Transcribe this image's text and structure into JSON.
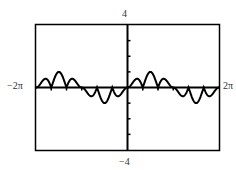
{
  "chart_data": {
    "type": "line",
    "title": "",
    "xlabel": "",
    "ylabel": "",
    "function": "y = sin(x) * |sin(3x)|",
    "xlim": [
      -6.2832,
      6.2832
    ],
    "ylim": [
      -4,
      4
    ],
    "x_tick_labels": {
      "min": "−2π",
      "max": "2π"
    },
    "y_tick_labels": {
      "min": "−4",
      "max": "4"
    },
    "y_tick_step": 1,
    "x_tick_step": 1.0472,
    "grid": false,
    "legend": null,
    "series": [
      {
        "name": "f(x)",
        "color": "#000000",
        "samples": {
          "x": [
            -6.2832,
            -5.7596,
            -5.236,
            -4.7124,
            -4.1888,
            -3.6652,
            -3.1416,
            -2.618,
            -2.0944,
            -1.5708,
            -1.0472,
            -0.5236,
            0,
            0.5236,
            1.0472,
            1.5708,
            2.0944,
            2.618,
            3.1416,
            3.6652,
            4.1888,
            4.7124,
            5.236,
            5.7596,
            6.2832
          ],
          "y": [
            0,
            0.5,
            0,
            1,
            0,
            0.5,
            0,
            -0.5,
            0,
            -1,
            0,
            -0.5,
            0,
            0.5,
            0,
            1,
            0,
            0.5,
            0,
            -0.5,
            0,
            -1,
            0,
            -0.5,
            0
          ]
        }
      }
    ]
  },
  "labels": {
    "y_max": "4",
    "y_min": "−4",
    "x_min": "−2π",
    "x_max": "2π"
  },
  "colors": {
    "frame": "#000000",
    "curve": "#000000",
    "text": "#333333"
  }
}
